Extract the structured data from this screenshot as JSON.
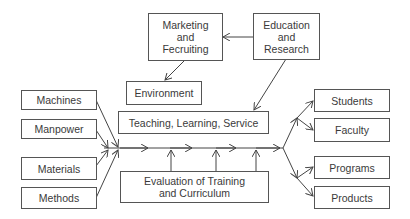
{
  "diagram": {
    "top": {
      "marketing": "Marketing\nand\nFecruiting",
      "education": "Education\nand\nResearch",
      "environment": "Environment"
    },
    "center": {
      "teaching": "Teaching, Learning, Service",
      "evaluation": "Evaluation of Training\nand Curriculum"
    },
    "inputs": [
      "Machines",
      "Manpower",
      "Materials",
      "Methods"
    ],
    "outputs": [
      "Students",
      "Faculty",
      "Programs",
      "Products"
    ],
    "colors": {
      "line": "#444444",
      "border": "#555555",
      "text": "#3a3a3a"
    }
  }
}
